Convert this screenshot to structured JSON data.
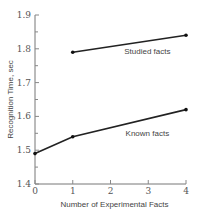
{
  "chart_data": {
    "type": "line",
    "title": "",
    "xlabel": "Number of Experimental Facts",
    "ylabel": "Recognition Time, sec",
    "xlim": [
      0,
      4
    ],
    "ylim": [
      1.4,
      1.9
    ],
    "x_ticks": [
      0,
      1,
      2,
      3,
      4
    ],
    "x_tick_labels": [
      "0",
      "1",
      "2",
      "3",
      "4"
    ],
    "y_ticks": [
      1.4,
      1.5,
      1.6,
      1.7,
      1.8,
      1.9
    ],
    "y_tick_labels": [
      "1.4",
      "1.5",
      "1.6",
      "1.7",
      "1.8",
      "1.9"
    ],
    "grid": false,
    "legend": "inline labels",
    "series": [
      {
        "name": "Studied facts",
        "x": [
          1,
          4
        ],
        "values": [
          1.79,
          1.84
        ]
      },
      {
        "name": "Known facts",
        "x": [
          0,
          1,
          4
        ],
        "values": [
          1.49,
          1.54,
          1.62
        ]
      }
    ]
  }
}
